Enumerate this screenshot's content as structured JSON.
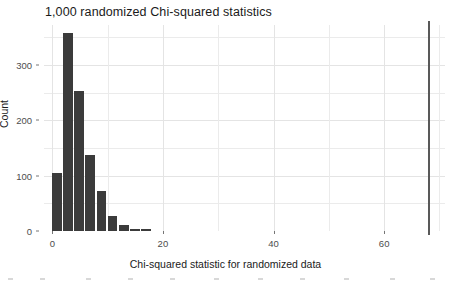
{
  "chart_data": {
    "type": "bar",
    "title": "1,000 randomized Chi-squared statistics",
    "xlabel": "Chi-squared statistic for randomized data",
    "ylabel": "Count",
    "xlim": [
      -1.5,
      71
    ],
    "ylim": [
      0,
      372
    ],
    "grid": true,
    "legend": null,
    "bin_width": 2,
    "x_centers": [
      1,
      3,
      5,
      7,
      9,
      11,
      13,
      15,
      17
    ],
    "bin_starts": [
      0,
      2,
      4,
      6,
      8,
      10,
      12,
      14,
      16
    ],
    "categories": [
      "0-2",
      "2-4",
      "4-6",
      "6-8",
      "8-10",
      "10-12",
      "12-14",
      "14-16",
      "16-18"
    ],
    "values": [
      105,
      357,
      252,
      138,
      72,
      28,
      11,
      4,
      3
    ],
    "xticks": [
      0,
      20,
      40,
      60
    ],
    "xtick_labels": [
      "0",
      "20",
      "40",
      "60"
    ],
    "yticks": [
      0,
      100,
      200,
      300
    ],
    "ytick_labels": [
      "0",
      "100",
      "200",
      "300"
    ],
    "y_minor_ticks": [
      50,
      150,
      250,
      350
    ],
    "x_minor_ticks": [
      10,
      30,
      50,
      70
    ],
    "annotations": [
      {
        "type": "vertical-reference-line",
        "name": "observed-statistic-line",
        "x": 68,
        "color": "#595959"
      }
    ],
    "colors": {
      "bar_fill": "#3b3b3b",
      "reference_line": "#595959",
      "grid_major": "#e4e4e4",
      "grid_minor": "#ebebeb",
      "panel_background": "#ffffff",
      "text": "#1a1a1a",
      "tick_text": "#4d4d4d"
    }
  }
}
